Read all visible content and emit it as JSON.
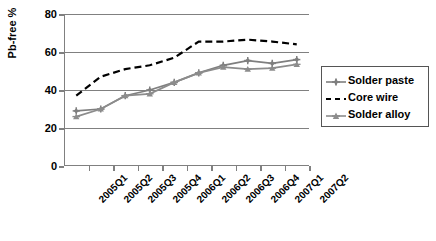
{
  "chart_data": {
    "type": "line",
    "title": "",
    "xlabel": "",
    "ylabel": "Pb-free %",
    "categories": [
      "2005Q1",
      "2005Q2",
      "2005Q3",
      "2005Q4",
      "2006Q1",
      "2006Q2",
      "2006Q3",
      "2006Q4",
      "2007Q1",
      "2007Q2"
    ],
    "yticks": [
      0,
      20,
      40,
      60,
      80
    ],
    "ylim": [
      0,
      80
    ],
    "grid": "horizontal",
    "legend_position": "right",
    "series": [
      {
        "name": "Solder paste",
        "color": "#7f7f7f",
        "style": "solid",
        "marker": "plus-diamond",
        "values": [
          29,
          30,
          37,
          40,
          44,
          49,
          53,
          55.5,
          54,
          56
        ]
      },
      {
        "name": "Core wire",
        "color": "#000000",
        "style": "dashed",
        "marker": "none",
        "values": [
          37,
          47,
          51,
          53,
          57,
          65.5,
          65.5,
          66.5,
          65.5,
          64
        ]
      },
      {
        "name": "Solder alloy",
        "color": "#8c8c8c",
        "style": "solid",
        "marker": "triangle",
        "values": [
          26,
          30,
          37,
          38,
          44,
          49,
          52,
          51,
          51.5,
          53.5
        ]
      }
    ]
  },
  "axis": {
    "y_title": "Pb-free %",
    "y_tick_labels": [
      "80",
      "60",
      "40",
      "20",
      "0"
    ],
    "x_tick_labels": [
      "2005Q1",
      "2005Q2",
      "2005Q3",
      "2005Q4",
      "2006Q1",
      "2006Q2",
      "2006Q3",
      "2006Q4",
      "2007Q1",
      "2007Q2"
    ]
  },
  "legend": {
    "items": [
      {
        "label": "Solder paste"
      },
      {
        "label": "Core wire"
      },
      {
        "label": "Solder alloy"
      }
    ]
  },
  "colors": {
    "axis": "#808080",
    "grid": "#808080",
    "series_paste": "#7f7f7f",
    "series_core": "#000000",
    "series_alloy": "#8c8c8c",
    "background": "#ffffff"
  }
}
